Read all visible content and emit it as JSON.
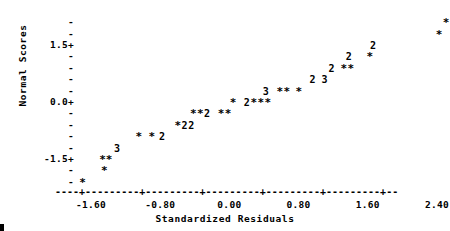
{
  "chart_data": {
    "type": "scatter",
    "title": "",
    "subtitle": "",
    "xlabel": "Standardized Residuals",
    "ylabel": "Normal Scores",
    "xlim": [
      -1.9,
      2.65
    ],
    "ylim": [
      -2.1,
      2.1
    ],
    "grid": false,
    "legend": null,
    "plot_style": "ascii-character-plot",
    "point_symbol": "*",
    "count_symbols": [
      "*",
      "2",
      "3"
    ],
    "symbol_note": "* = 1 observation, 2 = 2 observations, 3 = 3 observations at that cell",
    "xtick_labels": [
      "-1.60",
      "-0.80",
      "0.00",
      "0.80",
      "1.60",
      "2.40"
    ],
    "xtick_values": [
      -1.6,
      -0.8,
      0.0,
      0.8,
      1.6,
      2.4
    ],
    "ytick_labels": [
      "1.5+",
      "0.0+",
      "-1.5+"
    ],
    "ytick_values": [
      1.5,
      0.0,
      -1.5
    ],
    "y_minor_tick_values": [
      2.1,
      1.8,
      1.2,
      0.9,
      0.6,
      0.3,
      -0.3,
      -0.6,
      -0.9,
      -1.2,
      -1.8,
      -2.1
    ],
    "y_minor_tick_symbol": "-",
    "y_major_tick_symbol": "+",
    "x_axis_line_symbol": "-",
    "x_axis_tick_symbol": "+",
    "points": [
      {
        "x": -1.7,
        "y": -2.1,
        "n": 1,
        "symbol": "*"
      },
      {
        "x": -1.45,
        "y": -1.8,
        "n": 1,
        "symbol": "*"
      },
      {
        "x": -1.47,
        "y": -1.5,
        "n": 2,
        "symbol": "**"
      },
      {
        "x": -1.3,
        "y": -1.2,
        "n": 3,
        "symbol": "3"
      },
      {
        "x": -1.05,
        "y": -0.9,
        "n": 1,
        "symbol": "*"
      },
      {
        "x": -0.9,
        "y": -0.9,
        "n": 1,
        "symbol": "*"
      },
      {
        "x": -0.78,
        "y": -0.9,
        "n": 2,
        "symbol": "2"
      },
      {
        "x": -0.6,
        "y": -0.6,
        "n": 1,
        "symbol": "*"
      },
      {
        "x": -0.52,
        "y": -0.6,
        "n": 2,
        "symbol": "2"
      },
      {
        "x": -0.44,
        "y": -0.6,
        "n": 2,
        "symbol": "2"
      },
      {
        "x": -0.42,
        "y": -0.3,
        "n": 1,
        "symbol": "*"
      },
      {
        "x": -0.34,
        "y": -0.3,
        "n": 1,
        "symbol": "*"
      },
      {
        "x": -0.26,
        "y": -0.3,
        "n": 2,
        "symbol": "2"
      },
      {
        "x": -0.1,
        "y": -0.3,
        "n": 1,
        "symbol": "*"
      },
      {
        "x": -0.02,
        "y": -0.3,
        "n": 1,
        "symbol": "*"
      },
      {
        "x": 0.04,
        "y": 0.0,
        "n": 1,
        "symbol": "*"
      },
      {
        "x": 0.2,
        "y": 0.0,
        "n": 2,
        "symbol": "2"
      },
      {
        "x": 0.28,
        "y": 0.0,
        "n": 1,
        "symbol": "*"
      },
      {
        "x": 0.36,
        "y": 0.0,
        "n": 1,
        "symbol": "*"
      },
      {
        "x": 0.44,
        "y": 0.0,
        "n": 1,
        "symbol": "*"
      },
      {
        "x": 0.42,
        "y": 0.3,
        "n": 3,
        "symbol": "3"
      },
      {
        "x": 0.58,
        "y": 0.3,
        "n": 1,
        "symbol": "*"
      },
      {
        "x": 0.66,
        "y": 0.3,
        "n": 1,
        "symbol": "*"
      },
      {
        "x": 0.8,
        "y": 0.3,
        "n": 1,
        "symbol": "*"
      },
      {
        "x": 0.96,
        "y": 0.6,
        "n": 2,
        "symbol": "2"
      },
      {
        "x": 1.1,
        "y": 0.6,
        "n": 3,
        "symbol": "3"
      },
      {
        "x": 1.18,
        "y": 0.9,
        "n": 2,
        "symbol": "2"
      },
      {
        "x": 1.32,
        "y": 0.9,
        "n": 1,
        "symbol": "*"
      },
      {
        "x": 1.4,
        "y": 0.9,
        "n": 1,
        "symbol": "*"
      },
      {
        "x": 1.38,
        "y": 1.2,
        "n": 2,
        "symbol": "2"
      },
      {
        "x": 1.62,
        "y": 1.2,
        "n": 1,
        "symbol": "*"
      },
      {
        "x": 1.66,
        "y": 1.5,
        "n": 2,
        "symbol": "2"
      },
      {
        "x": 2.42,
        "y": 1.8,
        "n": 1,
        "symbol": "*"
      },
      {
        "x": 2.5,
        "y": 2.1,
        "n": 1,
        "symbol": "*"
      }
    ],
    "total_observations": 55
  },
  "axes": {
    "y_label": "Normal Scores",
    "x_label": "Standardized Residuals",
    "y_ticks": [
      {
        "label": "",
        "mark": "-",
        "value": 2.1
      },
      {
        "label": "",
        "mark": "-",
        "value": 1.8
      },
      {
        "label": "1.5+",
        "mark": "+",
        "value": 1.5
      },
      {
        "label": "",
        "mark": "-",
        "value": 1.2
      },
      {
        "label": "",
        "mark": "-",
        "value": 0.9
      },
      {
        "label": "",
        "mark": "-",
        "value": 0.6
      },
      {
        "label": "",
        "mark": "-",
        "value": 0.3
      },
      {
        "label": "0.0+",
        "mark": "+",
        "value": 0.0
      },
      {
        "label": "",
        "mark": "-",
        "value": -0.3
      },
      {
        "label": "",
        "mark": "-",
        "value": -0.6
      },
      {
        "label": "",
        "mark": "-",
        "value": -0.9
      },
      {
        "label": "",
        "mark": "-",
        "value": -1.2
      },
      {
        "label": "-1.5+",
        "mark": "+",
        "value": -1.5
      },
      {
        "label": "",
        "mark": "-",
        "value": -1.8
      },
      {
        "label": "",
        "mark": "-",
        "value": -2.1
      }
    ],
    "x_ticks": [
      {
        "label": "-1.60",
        "value": -1.6
      },
      {
        "label": "-0.80",
        "value": -0.8
      },
      {
        "label": "0.00",
        "value": 0.0
      },
      {
        "label": "0.80",
        "value": 0.8
      },
      {
        "label": "1.60",
        "value": 1.6
      },
      {
        "label": "2.40",
        "value": 2.4
      }
    ],
    "x_axis_line": "----+---------+---------+---------+---------+---------+--"
  },
  "colors": {
    "ink": "#000000",
    "background": "#ffffff"
  }
}
